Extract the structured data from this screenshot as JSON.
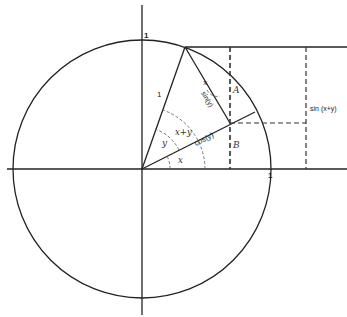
{
  "diagram": {
    "colors": {
      "stroke": "#222222",
      "dashed": "#333333",
      "background": "#ffffff"
    },
    "labels": {
      "top_one": "1",
      "right_one": "1",
      "hypotenuse_one": "1",
      "sin_y": "sin(y)",
      "cos_y": "cos(y)",
      "angle_x_upper": "x",
      "angle_y": "y",
      "angle_x_plus_y": "x+y",
      "angle_x_lower": "x",
      "point_A": "A",
      "point_B": "B",
      "sin_x_plus_y": "sin (x+y)"
    }
  }
}
